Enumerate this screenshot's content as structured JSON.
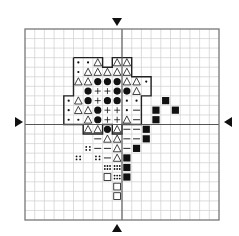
{
  "chart": {
    "grid": {
      "cols": 20,
      "rows": 20,
      "left": 25,
      "top": 29,
      "width": 194,
      "height": 191,
      "center_col": 10,
      "center_row": 10
    },
    "colors": {
      "grid_line": "#cfcfcf",
      "grid_border": "#777777",
      "center_line": "#555555",
      "symbol": "#111111",
      "outline": "#222222"
    },
    "center_markers": [
      "top-arrow",
      "bottom-arrow",
      "left-arrow",
      "right-arrow"
    ],
    "legend_symbols": {
      "dot": "small dot",
      "tri": "open triangle",
      "circ": "filled circle",
      "plus": "plus sign",
      "dash": "dash",
      "sq": "filled square",
      "osq": "open square",
      "d4": "four dots",
      "d6": "six dots"
    },
    "cells": [
      {
        "r": 3,
        "c": 5,
        "s": "dot"
      },
      {
        "r": 3,
        "c": 6,
        "s": "dot"
      },
      {
        "r": 3,
        "c": 7,
        "s": "tri"
      },
      {
        "r": 3,
        "c": 9,
        "s": "tri"
      },
      {
        "r": 3,
        "c": 10,
        "s": "tri"
      },
      {
        "r": 4,
        "c": 5,
        "s": "dot"
      },
      {
        "r": 4,
        "c": 6,
        "s": "tri"
      },
      {
        "r": 4,
        "c": 7,
        "s": "tri"
      },
      {
        "r": 4,
        "c": 8,
        "s": "tri"
      },
      {
        "r": 4,
        "c": 9,
        "s": "tri"
      },
      {
        "r": 4,
        "c": 10,
        "s": "tri"
      },
      {
        "r": 5,
        "c": 5,
        "s": "tri"
      },
      {
        "r": 5,
        "c": 6,
        "s": "tri"
      },
      {
        "r": 5,
        "c": 7,
        "s": "circ"
      },
      {
        "r": 5,
        "c": 8,
        "s": "circ"
      },
      {
        "r": 5,
        "c": 9,
        "s": "circ"
      },
      {
        "r": 5,
        "c": 10,
        "s": "tri"
      },
      {
        "r": 5,
        "c": 11,
        "s": "tri"
      },
      {
        "r": 5,
        "c": 12,
        "s": "dot"
      },
      {
        "r": 6,
        "c": 6,
        "s": "circ"
      },
      {
        "r": 6,
        "c": 7,
        "s": "plus"
      },
      {
        "r": 6,
        "c": 8,
        "s": "plus"
      },
      {
        "r": 6,
        "c": 9,
        "s": "circ"
      },
      {
        "r": 6,
        "c": 10,
        "s": "circ"
      },
      {
        "r": 6,
        "c": 11,
        "s": "tri"
      },
      {
        "r": 7,
        "c": 4,
        "s": "dot"
      },
      {
        "r": 7,
        "c": 5,
        "s": "tri"
      },
      {
        "r": 7,
        "c": 6,
        "s": "circ"
      },
      {
        "r": 7,
        "c": 7,
        "s": "plus"
      },
      {
        "r": 7,
        "c": 8,
        "s": "circ"
      },
      {
        "r": 7,
        "c": 9,
        "s": "circ"
      },
      {
        "r": 7,
        "c": 10,
        "s": "dot"
      },
      {
        "r": 7,
        "c": 11,
        "s": "dot"
      },
      {
        "r": 7,
        "c": 14,
        "s": "sq"
      },
      {
        "r": 8,
        "c": 4,
        "s": "dot"
      },
      {
        "r": 8,
        "c": 5,
        "s": "tri"
      },
      {
        "r": 8,
        "c": 6,
        "s": "tri"
      },
      {
        "r": 8,
        "c": 7,
        "s": "circ"
      },
      {
        "r": 8,
        "c": 8,
        "s": "plus"
      },
      {
        "r": 8,
        "c": 9,
        "s": "plus"
      },
      {
        "r": 8,
        "c": 10,
        "s": "dot"
      },
      {
        "r": 8,
        "c": 11,
        "s": "dash"
      },
      {
        "r": 8,
        "c": 13,
        "s": "sq"
      },
      {
        "r": 8,
        "c": 15,
        "s": "sq"
      },
      {
        "r": 9,
        "c": 4,
        "s": "dot"
      },
      {
        "r": 9,
        "c": 5,
        "s": "dot"
      },
      {
        "r": 9,
        "c": 6,
        "s": "tri"
      },
      {
        "r": 9,
        "c": 7,
        "s": "circ"
      },
      {
        "r": 9,
        "c": 8,
        "s": "plus"
      },
      {
        "r": 9,
        "c": 9,
        "s": "plus"
      },
      {
        "r": 9,
        "c": 10,
        "s": "tri"
      },
      {
        "r": 9,
        "c": 11,
        "s": "dash"
      },
      {
        "r": 9,
        "c": 13,
        "s": "sq"
      },
      {
        "r": 10,
        "c": 6,
        "s": "tri"
      },
      {
        "r": 10,
        "c": 7,
        "s": "tri"
      },
      {
        "r": 10,
        "c": 8,
        "s": "circ"
      },
      {
        "r": 10,
        "c": 9,
        "s": "tri"
      },
      {
        "r": 10,
        "c": 10,
        "s": "dash"
      },
      {
        "r": 10,
        "c": 11,
        "s": "dash"
      },
      {
        "r": 10,
        "c": 12,
        "s": "sq"
      },
      {
        "r": 11,
        "c": 7,
        "s": "dash"
      },
      {
        "r": 11,
        "c": 8,
        "s": "tri"
      },
      {
        "r": 11,
        "c": 9,
        "s": "tri"
      },
      {
        "r": 11,
        "c": 10,
        "s": "dash"
      },
      {
        "r": 11,
        "c": 11,
        "s": "dash"
      },
      {
        "r": 11,
        "c": 12,
        "s": "sq"
      },
      {
        "r": 12,
        "c": 6,
        "s": "d4"
      },
      {
        "r": 12,
        "c": 7,
        "s": "dash"
      },
      {
        "r": 12,
        "c": 8,
        "s": "dash"
      },
      {
        "r": 12,
        "c": 9,
        "s": "tri"
      },
      {
        "r": 12,
        "c": 10,
        "s": "dash"
      },
      {
        "r": 12,
        "c": 11,
        "s": "sq"
      },
      {
        "r": 13,
        "c": 5,
        "s": "d4"
      },
      {
        "r": 13,
        "c": 7,
        "s": "d4"
      },
      {
        "r": 13,
        "c": 8,
        "s": "dash"
      },
      {
        "r": 13,
        "c": 9,
        "s": "tri"
      },
      {
        "r": 13,
        "c": 10,
        "s": "sq"
      },
      {
        "r": 14,
        "c": 8,
        "s": "d6"
      },
      {
        "r": 14,
        "c": 9,
        "s": "d6"
      },
      {
        "r": 14,
        "c": 10,
        "s": "sq"
      },
      {
        "r": 15,
        "c": 8,
        "s": "osq"
      },
      {
        "r": 15,
        "c": 9,
        "s": "d6"
      },
      {
        "r": 15,
        "c": 10,
        "s": "sq"
      },
      {
        "r": 16,
        "c": 9,
        "s": "osq"
      },
      {
        "r": 17,
        "c": 9,
        "s": "osq"
      }
    ],
    "outline": [
      [
        5,
        3
      ],
      [
        8,
        3
      ],
      [
        8,
        4
      ],
      [
        9,
        4
      ],
      [
        9,
        3
      ],
      [
        11,
        3
      ],
      [
        11,
        5
      ],
      [
        13,
        5
      ],
      [
        13,
        7
      ],
      [
        12,
        7
      ],
      [
        12,
        10
      ],
      [
        10,
        10
      ],
      [
        10,
        11
      ],
      [
        9,
        11
      ],
      [
        9,
        10
      ],
      [
        8,
        10
      ],
      [
        8,
        11
      ],
      [
        6,
        11
      ],
      [
        6,
        10
      ],
      [
        4,
        10
      ],
      [
        4,
        7
      ],
      [
        5,
        7
      ],
      [
        5,
        3
      ]
    ]
  }
}
